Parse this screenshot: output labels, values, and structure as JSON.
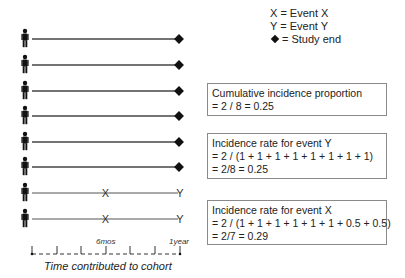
{
  "legend": {
    "x_label": "X = Event X",
    "y_label": "Y = Event Y",
    "end_label": "= Study end"
  },
  "participants": [
    {
      "row": 1,
      "end_marker": "diamond",
      "event_x_at": null,
      "event_y_at": null
    },
    {
      "row": 2,
      "end_marker": "diamond",
      "event_x_at": null,
      "event_y_at": null
    },
    {
      "row": 3,
      "end_marker": "diamond",
      "event_x_at": null,
      "event_y_at": null
    },
    {
      "row": 4,
      "end_marker": "diamond",
      "event_x_at": null,
      "event_y_at": null
    },
    {
      "row": 5,
      "end_marker": "diamond",
      "event_x_at": null,
      "event_y_at": null
    },
    {
      "row": 6,
      "end_marker": "diamond",
      "event_x_at": null,
      "event_y_at": null
    },
    {
      "row": 7,
      "end_marker": "Y",
      "event_x_at": "6mos",
      "event_y_at": "1year"
    },
    {
      "row": 8,
      "end_marker": "Y",
      "event_x_at": "6mos",
      "event_y_at": "1year"
    }
  ],
  "markers": {
    "x": "X",
    "y": "Y"
  },
  "axis": {
    "mid_label": "6mos",
    "end_label": "1year",
    "title": "Time contributed to cohort"
  },
  "boxes": [
    {
      "title": "Cumulative incidence proportion",
      "lines": [
        "= 2 / 8 = 0.25"
      ]
    },
    {
      "title": "Incidence rate for event Y",
      "lines": [
        "=  2 / (1 + 1 + 1 + 1 + 1 + 1 + 1 + 1)",
        "= 2/8 = 0.25"
      ]
    },
    {
      "title": "Incidence rate for event X",
      "lines": [
        "=  2 / (1 + 1 + 1 + 1 + 1 + 1 + 0.5 + 0.5)",
        "= 2/7 = 0.29"
      ]
    }
  ]
}
